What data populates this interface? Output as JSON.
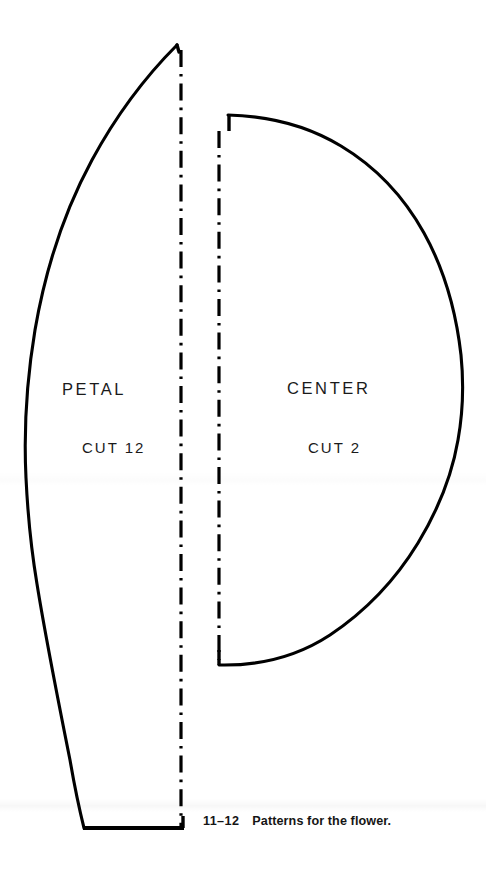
{
  "figure": {
    "caption_number": "11–12",
    "caption_text": "Patterns for the flower.",
    "background_color": "#ffffff",
    "ink_color": "#000000"
  },
  "pieces": [
    {
      "id": "petal",
      "name": "PETAL",
      "cut_instruction": "CUT 12",
      "fold_line": "dash-dot"
    },
    {
      "id": "center",
      "name": "CENTER",
      "cut_instruction": "CUT 2",
      "fold_line": "dash-dot"
    }
  ],
  "labels": {
    "petal_name": "PETAL",
    "petal_cut": "CUT 12",
    "center_name": "CENTER",
    "center_cut": "CUT 2"
  },
  "icons": {
    "petal_outline": "petal-pattern-outline",
    "center_outline": "center-pattern-outline",
    "petal_fold": "fold-line",
    "center_fold": "fold-line"
  }
}
